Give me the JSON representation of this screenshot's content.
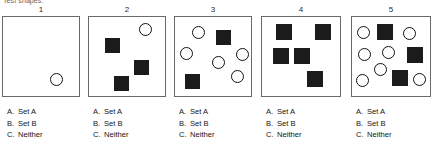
{
  "header": {
    "prompt": "Test shapes:"
  },
  "answer_options": [
    {
      "letter": "A.",
      "text": "Set A"
    },
    {
      "letter": "B.",
      "text": "Set B"
    },
    {
      "letter": "C.",
      "text": "Neither"
    }
  ],
  "panels": [
    {
      "number": "1",
      "box": {
        "width": 78,
        "height": 81,
        "left": 2
      },
      "shape_counts": {
        "circles": 1,
        "squares": 0
      },
      "shapes": [
        {
          "type": "circle",
          "x": 47,
          "y": 56,
          "size": 13
        }
      ],
      "options": [
        {
          "letter": "A.",
          "text": "Set A"
        },
        {
          "letter": "B.",
          "text": "Set B"
        },
        {
          "letter": "C.",
          "text": "Neither"
        }
      ]
    },
    {
      "number": "2",
      "box": {
        "width": 78,
        "height": 81,
        "left": 88
      },
      "shape_counts": {
        "circles": 1,
        "squares": 3
      },
      "shapes": [
        {
          "type": "circle",
          "x": 50,
          "y": 6,
          "size": 13
        },
        {
          "type": "square",
          "x": 16,
          "y": 21,
          "size": 15
        },
        {
          "type": "square",
          "x": 45,
          "y": 43,
          "size": 15
        },
        {
          "type": "square",
          "x": 25,
          "y": 59,
          "size": 15
        }
      ],
      "options": [
        {
          "letter": "A.",
          "text": "Set A"
        },
        {
          "letter": "B.",
          "text": "Set B"
        },
        {
          "letter": "C.",
          "text": "Neither"
        }
      ]
    },
    {
      "number": "3",
      "box": {
        "width": 78,
        "height": 81,
        "left": 174
      },
      "shape_counts": {
        "circles": 5,
        "squares": 2
      },
      "shapes": [
        {
          "type": "circle",
          "x": 17,
          "y": 9,
          "size": 13
        },
        {
          "type": "square",
          "x": 41,
          "y": 13,
          "size": 15
        },
        {
          "type": "circle",
          "x": 5,
          "y": 30,
          "size": 13
        },
        {
          "type": "circle",
          "x": 37,
          "y": 39,
          "size": 13
        },
        {
          "type": "circle",
          "x": 61,
          "y": 31,
          "size": 13
        },
        {
          "type": "circle",
          "x": 56,
          "y": 53,
          "size": 13
        },
        {
          "type": "square",
          "x": 10,
          "y": 57,
          "size": 15
        }
      ],
      "options": [
        {
          "letter": "A.",
          "text": "Set A"
        },
        {
          "letter": "B.",
          "text": "Set B"
        },
        {
          "letter": "C.",
          "text": "Neither"
        }
      ]
    },
    {
      "number": "4",
      "box": {
        "width": 80,
        "height": 81,
        "left": 261
      },
      "shape_counts": {
        "circles": 0,
        "squares": 5
      },
      "shapes": [
        {
          "type": "square",
          "x": 14,
          "y": 7,
          "size": 16
        },
        {
          "type": "square",
          "x": 53,
          "y": 7,
          "size": 16
        },
        {
          "type": "square",
          "x": 11,
          "y": 31,
          "size": 16
        },
        {
          "type": "square",
          "x": 32,
          "y": 31,
          "size": 16
        },
        {
          "type": "square",
          "x": 45,
          "y": 54,
          "size": 16
        }
      ],
      "options": [
        {
          "letter": "A.",
          "text": "Set A"
        },
        {
          "letter": "B.",
          "text": "Set B"
        },
        {
          "letter": "C.",
          "text": "Neither"
        }
      ]
    },
    {
      "number": "5",
      "box": {
        "width": 80,
        "height": 81,
        "left": 351
      },
      "shape_counts": {
        "circles": 7,
        "squares": 3
      },
      "shapes": [
        {
          "type": "circle",
          "x": 5,
          "y": 9,
          "size": 13
        },
        {
          "type": "square",
          "x": 25,
          "y": 7,
          "size": 16
        },
        {
          "type": "circle",
          "x": 51,
          "y": 10,
          "size": 13
        },
        {
          "type": "circle",
          "x": 6,
          "y": 31,
          "size": 13
        },
        {
          "type": "circle",
          "x": 30,
          "y": 29,
          "size": 13
        },
        {
          "type": "square",
          "x": 55,
          "y": 30,
          "size": 16
        },
        {
          "type": "circle",
          "x": 22,
          "y": 46,
          "size": 13
        },
        {
          "type": "circle",
          "x": 4,
          "y": 57,
          "size": 13
        },
        {
          "type": "square",
          "x": 40,
          "y": 53,
          "size": 16
        },
        {
          "type": "circle",
          "x": 61,
          "y": 56,
          "size": 13
        }
      ],
      "options": [
        {
          "letter": "A.",
          "text": "Set A"
        },
        {
          "letter": "B.",
          "text": "Set B"
        },
        {
          "letter": "C.",
          "text": "Neither"
        }
      ]
    }
  ]
}
